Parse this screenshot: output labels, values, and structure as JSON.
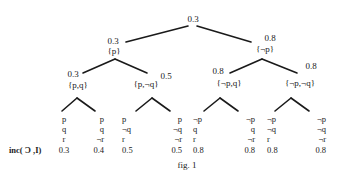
{
  "figure": {
    "caption": "fig. 1",
    "row_label": "inc( Ɔ ,I)"
  },
  "tree": {
    "root": {
      "value": "0.3"
    },
    "level1": [
      {
        "value": "0.3",
        "set": "{p}"
      },
      {
        "value": "0.8",
        "set": "{¬p}"
      }
    ],
    "level2": [
      {
        "value": "0.3",
        "set": "{p,q}"
      },
      {
        "value": "0.5",
        "set": "{p,¬q}"
      },
      {
        "value": "0.8",
        "set": "{¬p,q}"
      },
      {
        "value": "0.8",
        "set": "{¬p,¬q}"
      }
    ],
    "leaves": [
      {
        "p": "p",
        "q": "q",
        "r": "r",
        "inc": "0.3"
      },
      {
        "p": "p",
        "q": "q",
        "r": "¬r",
        "inc": "0.4"
      },
      {
        "p": "p",
        "q": "¬q",
        "r": "r",
        "inc": "0.5"
      },
      {
        "p": "p",
        "q": "¬q",
        "r": "¬r",
        "inc": "0.5"
      },
      {
        "p": "¬p",
        "q": "q",
        "r": "r",
        "inc": "0.8"
      },
      {
        "p": "¬p",
        "q": "q",
        "r": "¬r",
        "inc": "0.8"
      },
      {
        "p": "¬p",
        "q": "¬q",
        "r": "r",
        "inc": "0.8"
      },
      {
        "p": "¬p",
        "q": "¬q",
        "r": "¬r",
        "inc": "0.8"
      }
    ]
  }
}
